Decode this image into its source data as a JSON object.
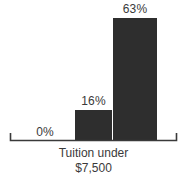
{
  "chart_data": {
    "type": "bar",
    "title": "",
    "subtitle": "",
    "xlabel": "Tuition under $7,500",
    "ylabel": "",
    "categories": [
      "",
      "",
      ""
    ],
    "values": [
      0,
      16,
      63
    ],
    "value_labels": [
      "0%",
      "16%",
      "63%"
    ],
    "ylim": [
      0,
      72
    ],
    "grid": false,
    "legend": false,
    "legend_position": "none",
    "bar_color": "#2e2e2e",
    "text_color": "#3a3a3a",
    "axis_color": "#3a3a3a",
    "background_color": "#ffffff"
  },
  "axis": {
    "baseline_label": "category-axis"
  },
  "caption": {
    "line1": "Tuition under",
    "line2": "$7,500"
  }
}
